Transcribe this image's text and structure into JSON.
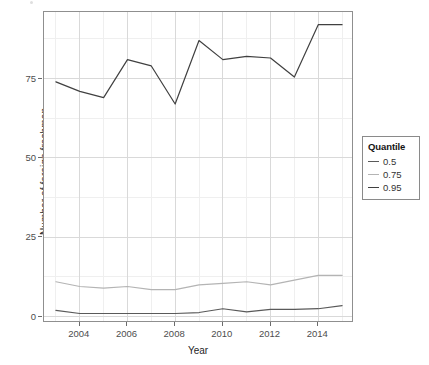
{
  "chart_data": {
    "type": "line",
    "title": "",
    "xlabel": "Year",
    "ylabel": "Number of foreign freshmen",
    "x": [
      2003,
      2004,
      2005,
      2006,
      2007,
      2008,
      2009,
      2010,
      2011,
      2012,
      2013,
      2014,
      2015
    ],
    "xlim": [
      2002.5,
      2015.5
    ],
    "ylim": [
      -2,
      96
    ],
    "grid": true,
    "legend": {
      "title": "Quantile",
      "position": "right",
      "entries": [
        "0.5",
        "0.75",
        "0.95"
      ]
    },
    "xticks": [
      2004,
      2006,
      2008,
      2010,
      2012,
      2014
    ],
    "yticks": [
      0,
      25,
      50,
      75
    ],
    "series": [
      {
        "name": "0.5",
        "color": "#5a5a5a",
        "values": [
          2,
          1,
          1,
          1,
          1,
          1,
          1.3,
          2.5,
          1.5,
          2.3,
          2.3,
          2.5,
          3.5
        ]
      },
      {
        "name": "0.75",
        "color": "#b4b4b4",
        "values": [
          11,
          9.5,
          9,
          9.5,
          8.5,
          8.5,
          10,
          10.5,
          11,
          10,
          11.5,
          13,
          13
        ]
      },
      {
        "name": "0.95",
        "color": "#404040",
        "values": [
          74,
          71,
          69,
          81,
          79,
          67,
          87,
          81,
          82,
          81.5,
          75.5,
          92,
          92
        ]
      }
    ]
  },
  "axes": {
    "x_title": "Year",
    "y_title": "Number of foreign freshmen",
    "x_tick_labels": [
      "2004",
      "2006",
      "2008",
      "2010",
      "2012",
      "2014"
    ],
    "y_tick_labels": [
      "0",
      "25",
      "50",
      "75"
    ]
  },
  "legend": {
    "title": "Quantile",
    "items": [
      {
        "label": "0.5",
        "color": "#5a5a5a"
      },
      {
        "label": "0.75",
        "color": "#b4b4b4"
      },
      {
        "label": "0.95",
        "color": "#404040"
      }
    ]
  },
  "colors": {
    "panel_border": "#8f8f8f",
    "major_grid": "#d9d9d9",
    "minor_grid": "#efefef",
    "background": "#ffffff"
  }
}
